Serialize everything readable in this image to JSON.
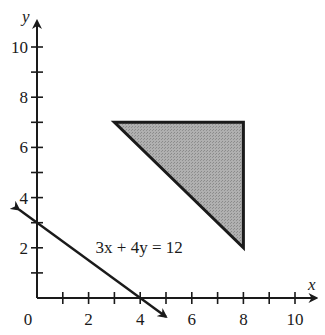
{
  "chart_data": {
    "type": "line",
    "title": "",
    "xlabel": "x",
    "ylabel": "y",
    "xlim": [
      0,
      10.6
    ],
    "ylim": [
      0,
      10.8
    ],
    "grid": false,
    "x_ticks": [
      1,
      2,
      3,
      4,
      5,
      6,
      7,
      8,
      9,
      10
    ],
    "x_tick_labels": [
      {
        "value": 0,
        "label": "0"
      },
      {
        "value": 2,
        "label": "2"
      },
      {
        "value": 4,
        "label": "4"
      },
      {
        "value": 6,
        "label": "6"
      },
      {
        "value": 8,
        "label": "8"
      },
      {
        "value": 10,
        "label": "10"
      }
    ],
    "y_ticks": [
      1,
      2,
      3,
      4,
      5,
      6,
      7,
      8,
      9,
      10
    ],
    "y_tick_labels": [
      {
        "value": 2,
        "label": "2"
      },
      {
        "value": 4,
        "label": "4"
      },
      {
        "value": 6,
        "label": "6"
      },
      {
        "value": 8,
        "label": "8"
      },
      {
        "value": 10,
        "label": "10"
      }
    ],
    "series": [
      {
        "name": "3x + 4y = 12",
        "kind": "line-with-arrows",
        "equation": "3x + 4y = 12",
        "points": [
          [
            -0.7,
            3.525
          ],
          [
            5.0,
            -0.75
          ]
        ],
        "color": "#1a1a1a"
      },
      {
        "name": "shaded-triangle",
        "kind": "polygon",
        "vertices": [
          [
            3,
            7
          ],
          [
            8,
            7
          ],
          [
            8,
            2
          ]
        ],
        "fill": "#a8a8a8",
        "stroke": "#1a1a1a"
      }
    ],
    "annotations": [
      {
        "text": "3x + 4y = 12",
        "x": 3.9,
        "y": 2.05
      }
    ]
  }
}
